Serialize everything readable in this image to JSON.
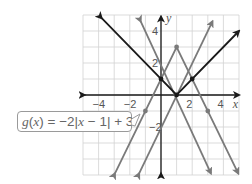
{
  "chart_data": {
    "type": "line",
    "title": "",
    "xlabel": "x",
    "ylabel": "y",
    "xlim": [
      -5,
      5
    ],
    "ylim": [
      -5,
      5
    ],
    "grid": true,
    "x_tick_labels": [
      "-4",
      "-2",
      "2",
      "4"
    ],
    "y_tick_labels": [
      "4",
      "2",
      "-2"
    ],
    "series": [
      {
        "name": "f(x) = |x - 1|",
        "color": "#1a1a1a",
        "vertex": [
          1,
          0
        ],
        "points": [
          [
            -4,
            5
          ],
          [
            0,
            1
          ],
          [
            1,
            0
          ],
          [
            2,
            1
          ],
          [
            5,
            4
          ]
        ],
        "marked_points": [
          [
            0,
            1
          ],
          [
            1,
            0
          ],
          [
            2,
            1
          ]
        ]
      },
      {
        "name": "y = 2|x - 1| (upward V)",
        "color": "#7a7a7a",
        "vertex": [
          1,
          0
        ],
        "points": [
          [
            -1.5,
            5
          ],
          [
            1,
            0
          ],
          [
            3.5,
            5
          ]
        ]
      },
      {
        "name": "y = -2|x - 1| (downward V)",
        "color": "#7a7a7a",
        "vertex": [
          1,
          0
        ],
        "points": [
          [
            -1.5,
            -5
          ],
          [
            1,
            0
          ],
          [
            3.5,
            -5
          ]
        ]
      },
      {
        "name": "g(x) = -2|x - 1| + 3",
        "color": "#7a7a7a",
        "vertex": [
          1,
          3
        ],
        "points": [
          [
            -3,
            -5
          ],
          [
            -1,
            -1
          ],
          [
            1,
            3
          ],
          [
            3,
            -1
          ],
          [
            5,
            -5
          ]
        ],
        "marked_points": [
          [
            -1,
            -1
          ],
          [
            1,
            3
          ],
          [
            3,
            -1
          ]
        ]
      }
    ],
    "annotations": [
      {
        "text": "g(x) = −2|x − 1| + 3",
        "points_to": [
          -1,
          -1
        ]
      }
    ]
  },
  "axes": {
    "x_label": "x",
    "y_label": "y"
  },
  "ticks": {
    "x": [
      "−4",
      "−2",
      "2",
      "4"
    ],
    "y": [
      "4",
      "2",
      "−2"
    ]
  },
  "callout": {
    "fn": "g",
    "arg": "x",
    "rest": " = −2|",
    "var": "x",
    "tail": " − 1| + 3"
  }
}
